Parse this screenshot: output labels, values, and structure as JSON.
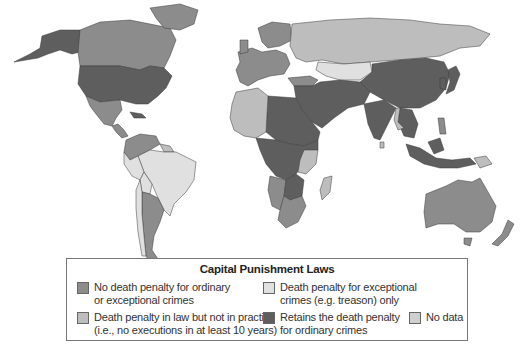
{
  "legend": {
    "title": "Capital Punishment Laws",
    "items": [
      {
        "label": "No death penalty for ordinary\nor exceptional crimes",
        "color": "#8c8c8c"
      },
      {
        "label": "Death penalty for exceptional\ncrimes (e.g. treason) only",
        "color": "#e0e0e0"
      },
      {
        "label": "Death penalty in law but not in practice\n(i.e., no executions in at least 10 years)",
        "color": "#bdbdbd"
      },
      {
        "label": "Retains the death penalty\nfor ordinary crimes",
        "color": "#5e5e5e"
      },
      {
        "label": "No data",
        "color": "#cfcfcf"
      }
    ]
  },
  "map": {
    "colors": {
      "abolished": "#8c8c8c",
      "exceptional": "#e0e0e0",
      "in_law_not_practice": "#bdbdbd",
      "retains": "#5e5e5e",
      "no_data": "#cfcfcf"
    },
    "regions": [
      {
        "name": "Alaska",
        "category": "retains"
      },
      {
        "name": "Canada",
        "category": "abolished"
      },
      {
        "name": "Greenland",
        "category": "abolished"
      },
      {
        "name": "United States",
        "category": "retains"
      },
      {
        "name": "Mexico",
        "category": "abolished"
      },
      {
        "name": "Central America",
        "category": "abolished"
      },
      {
        "name": "Cuba",
        "category": "retains"
      },
      {
        "name": "Venezuela / Colombia",
        "category": "abolished"
      },
      {
        "name": "Brazil",
        "category": "exceptional"
      },
      {
        "name": "Peru",
        "category": "exceptional"
      },
      {
        "name": "Bolivia",
        "category": "exceptional"
      },
      {
        "name": "Argentina",
        "category": "abolished"
      },
      {
        "name": "Chile",
        "category": "exceptional"
      },
      {
        "name": "Western Europe",
        "category": "abolished"
      },
      {
        "name": "Scandinavia",
        "category": "abolished"
      },
      {
        "name": "Russia",
        "category": "in_law_not_practice"
      },
      {
        "name": "Kazakhstan",
        "category": "exceptional"
      },
      {
        "name": "Turkey",
        "category": "abolished"
      },
      {
        "name": "Middle East",
        "category": "retains"
      },
      {
        "name": "North Africa",
        "category": "retains"
      },
      {
        "name": "West Africa",
        "category": "in_law_not_practice"
      },
      {
        "name": "Central Africa",
        "category": "retains"
      },
      {
        "name": "Southern Africa",
        "category": "abolished"
      },
      {
        "name": "Madagascar",
        "category": "in_law_not_practice"
      },
      {
        "name": "Mongolia / China",
        "category": "retains"
      },
      {
        "name": "India",
        "category": "retains"
      },
      {
        "name": "Southeast Asia",
        "category": "retains"
      },
      {
        "name": "Indonesia",
        "category": "retains"
      },
      {
        "name": "Japan",
        "category": "retains"
      },
      {
        "name": "Australia",
        "category": "abolished"
      },
      {
        "name": "New Zealand",
        "category": "abolished"
      }
    ]
  }
}
